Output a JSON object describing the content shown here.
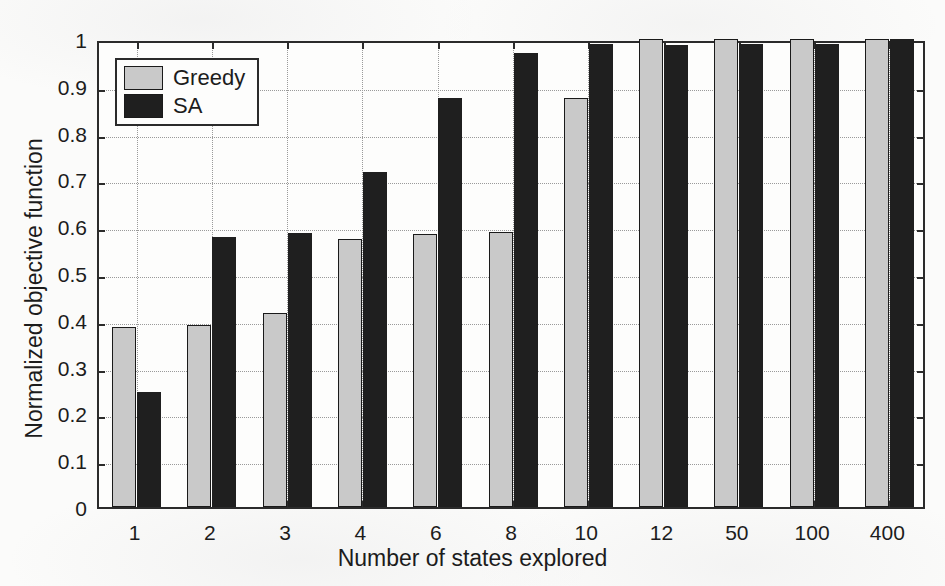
{
  "chart_data": {
    "type": "bar",
    "title": "",
    "xlabel": "Number of states explored",
    "ylabel": "Normalized objective function",
    "categories": [
      "1",
      "2",
      "3",
      "4",
      "6",
      "8",
      "10",
      "12",
      "50",
      "100",
      "400"
    ],
    "series": [
      {
        "name": "Greedy",
        "color": "#c9c9c9",
        "values": [
          0.385,
          0.388,
          0.415,
          0.573,
          0.583,
          0.587,
          0.873,
          1.0,
          1.0,
          1.0,
          1.0
        ]
      },
      {
        "name": "SA",
        "color": "#1f1f1f",
        "values": [
          0.245,
          0.577,
          0.585,
          0.715,
          0.873,
          0.97,
          0.99,
          0.988,
          0.99,
          0.99,
          1.0
        ]
      }
    ],
    "ylim": [
      0,
      1
    ],
    "ytick_labels": [
      "0",
      "0.1",
      "0.2",
      "0.3",
      "0.4",
      "0.5",
      "0.6",
      "0.7",
      "0.8",
      "0.9",
      "1"
    ],
    "ytick_values": [
      0,
      0.1,
      0.2,
      0.3,
      0.4,
      0.5,
      0.6,
      0.7,
      0.8,
      0.9,
      1
    ],
    "grid": true,
    "legend_position": "top-left"
  },
  "legend": {
    "entries": [
      {
        "label": "Greedy",
        "swatch": "greedy"
      },
      {
        "label": "SA",
        "swatch": "sa"
      }
    ]
  },
  "axis": {
    "x_title": "Number of states explored",
    "y_title": "Normalized objective function"
  }
}
